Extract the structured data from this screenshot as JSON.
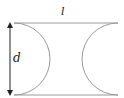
{
  "diagram": {
    "labels": {
      "length": "l",
      "diameter": "d"
    },
    "colors": {
      "line": "#9a9a9a",
      "arrow": "#222222",
      "text": "#222222"
    }
  }
}
